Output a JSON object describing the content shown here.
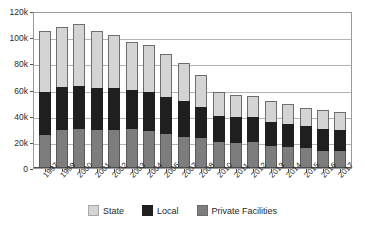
{
  "chart_data": {
    "type": "bar",
    "stacked": true,
    "title": "",
    "subtitle": "",
    "xlabel": "",
    "ylabel": "",
    "ylim": [
      0,
      120000
    ],
    "ytick_labels": [
      "0",
      "20k",
      "40k",
      "60k",
      "80k",
      "100k",
      "120k"
    ],
    "ytick_values": [
      0,
      20000,
      40000,
      60000,
      80000,
      100000,
      120000
    ],
    "grid": true,
    "legend_position": "bottom",
    "categories": [
      "1997",
      "1999",
      "2000",
      "2001",
      "2002",
      "2003",
      "2004",
      "2006",
      "2007",
      "2008",
      "2010",
      "2011",
      "2012",
      "2013",
      "2014",
      "2015",
      "2016",
      "2017"
    ],
    "series": [
      {
        "name": "Private Facilities",
        "color": "#7d7d7d",
        "values": [
          25000,
          29000,
          30000,
          29000,
          29000,
          30000,
          28000,
          26000,
          24000,
          23000,
          20000,
          19000,
          20000,
          17000,
          16000,
          15000,
          13000,
          13000
        ]
      },
      {
        "name": "Local",
        "color": "#1f1f1f",
        "values": [
          33000,
          33000,
          33000,
          32000,
          32000,
          30000,
          30000,
          28000,
          27000,
          24000,
          20000,
          20000,
          19000,
          18000,
          18000,
          17000,
          17000,
          16000
        ]
      },
      {
        "name": "State",
        "color": "#d4d4d4",
        "values": [
          47000,
          46000,
          47000,
          44000,
          41000,
          36000,
          36000,
          33000,
          29000,
          24000,
          18000,
          17000,
          16000,
          16000,
          15000,
          14000,
          14000,
          14000
        ]
      }
    ],
    "totals": [
      105000,
      108000,
      110000,
      105000,
      102000,
      96000,
      94000,
      87000,
      80000,
      71000,
      58000,
      56000,
      55000,
      51000,
      49000,
      46000,
      44000,
      43000
    ]
  },
  "legend": {
    "items": [
      {
        "label": "State",
        "swatch": "state-swatch"
      },
      {
        "label": "Local",
        "swatch": "local-swatch"
      },
      {
        "label": "Private Facilities",
        "swatch": "private-facilities-swatch"
      }
    ]
  }
}
